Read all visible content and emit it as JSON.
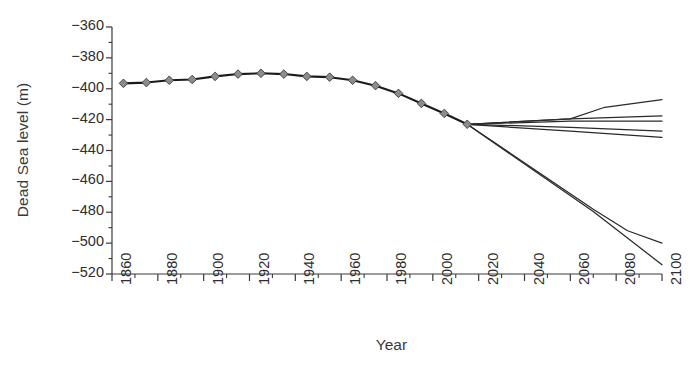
{
  "chart_data": {
    "type": "line",
    "title": "",
    "xlabel": "Year",
    "ylabel": "Dead Sea level (m)",
    "xlim": [
      1860,
      2100
    ],
    "ylim": [
      -520,
      -360
    ],
    "grid": false,
    "legend_position": "none",
    "x_tick_labels": [
      "1860",
      "1880",
      "1900",
      "1920",
      "1940",
      "1960",
      "1980",
      "2000",
      "2020",
      "2040",
      "2060",
      "2080",
      "2100"
    ],
    "x_ticks": [
      1860,
      1880,
      1900,
      1920,
      1940,
      1960,
      1980,
      2000,
      2020,
      2040,
      2060,
      2080,
      2100
    ],
    "x_minor_tick_interval": 10,
    "y_tick_labels": [
      "−360",
      "−380",
      "−400",
      "−420",
      "−440",
      "−460",
      "−480",
      "−500",
      "−520"
    ],
    "y_ticks": [
      -360,
      -380,
      -400,
      -420,
      -440,
      -460,
      -480,
      -500,
      -520
    ],
    "y_minor_tick_interval": 10,
    "series": [
      {
        "name": "Observed (historical) lake level",
        "style": "line-with-diamond-markers",
        "color": "#1a1a1a",
        "marker_fill": "#8c8c8c",
        "marker_edge": "#3a3a3a",
        "x": [
          1865,
          1875,
          1885,
          1895,
          1905,
          1915,
          1925,
          1935,
          1945,
          1955,
          1965,
          1975,
          1985,
          1995,
          2005,
          2015
        ],
        "values": [
          -396.5,
          -396.0,
          -394.5,
          -394.0,
          -392.0,
          -390.5,
          -390.0,
          -390.5,
          -392.0,
          -392.5,
          -394.5,
          -398.0,
          -403.0,
          -409.5,
          -416.0,
          -423.0
        ]
      },
      {
        "name": "Scenario 1 (recovery / rising)",
        "style": "line",
        "color": "#2a2a2a",
        "x": [
          2015,
          2060,
          2075,
          2100
        ],
        "values": [
          -423.0,
          -419.5,
          -412.0,
          -407.0
        ]
      },
      {
        "name": "Scenario 2 (near stable, slight rise)",
        "style": "line",
        "color": "#2a2a2a",
        "x": [
          2015,
          2060,
          2100
        ],
        "values": [
          -423.0,
          -419.5,
          -417.5
        ]
      },
      {
        "name": "Scenario 3 (stable)",
        "style": "line",
        "color": "#2a2a2a",
        "x": [
          2015,
          2060,
          2100
        ],
        "values": [
          -423.0,
          -421.0,
          -421.0
        ]
      },
      {
        "name": "Scenario 4 (slow decline)",
        "style": "line",
        "color": "#2a2a2a",
        "x": [
          2015,
          2060,
          2100
        ],
        "values": [
          -423.0,
          -425.0,
          -427.5
        ]
      },
      {
        "name": "Scenario 5 (moderate decline)",
        "style": "line",
        "color": "#2a2a2a",
        "x": [
          2015,
          2060,
          2100
        ],
        "values": [
          -423.0,
          -427.5,
          -431.5
        ]
      },
      {
        "name": "Scenario 6 (strong decline, levelling)",
        "style": "line",
        "color": "#2a2a2a",
        "x": [
          2015,
          2070,
          2085,
          2100
        ],
        "values": [
          -423.0,
          -478.0,
          -492.0,
          -500.0
        ]
      },
      {
        "name": "Scenario 7 (strongest decline)",
        "style": "line",
        "color": "#2a2a2a",
        "x": [
          2015,
          2070,
          2100
        ],
        "values": [
          -423.0,
          -479.5,
          -514.0
        ]
      }
    ]
  },
  "axes": {
    "ylabel": "Dead Sea level (m)",
    "xlabel": "Year"
  }
}
